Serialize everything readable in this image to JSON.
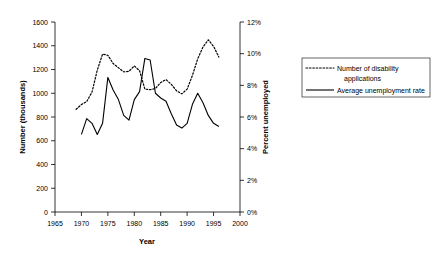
{
  "chart_data": {
    "type": "line",
    "title": "",
    "xlabel": "Year",
    "ylabel": "Number (thousands)",
    "y2label": "Percent unemployed",
    "xlim": [
      1965,
      2000
    ],
    "ylim": [
      0,
      1600
    ],
    "y2lim": [
      0,
      12
    ],
    "grid": false,
    "legend_position": "right",
    "x_ticks": [
      "1965",
      "1970",
      "1975",
      "1980",
      "1985",
      "1990",
      "1995",
      "2000"
    ],
    "x_tick_values": [
      1965,
      1970,
      1975,
      1980,
      1985,
      1990,
      1995,
      2000
    ],
    "y_ticks": [
      "0",
      "200",
      "400",
      "600",
      "800",
      "1000",
      "1200",
      "1400",
      "1600"
    ],
    "y_tick_values": [
      0,
      200,
      400,
      600,
      800,
      1000,
      1200,
      1400,
      1600
    ],
    "y2_ticks": [
      "0%",
      "2%",
      "4%",
      "6%",
      "8%",
      "10%",
      "12%"
    ],
    "y2_tick_values": [
      0,
      2,
      4,
      6,
      8,
      10,
      12
    ],
    "series": [
      {
        "name": "Number of disability applications",
        "style": "dotted",
        "axis": "left",
        "units": "thousands",
        "x": [
          1969,
          1970,
          1971,
          1972,
          1973,
          1974,
          1975,
          1976,
          1977,
          1978,
          1979,
          1980,
          1981,
          1982,
          1983,
          1984,
          1985,
          1986,
          1987,
          1988,
          1989,
          1990,
          1991,
          1992,
          1993,
          1994,
          1995,
          1996
        ],
        "values": [
          865,
          905,
          930,
          1010,
          1195,
          1330,
          1320,
          1250,
          1215,
          1180,
          1185,
          1230,
          1190,
          1035,
          1030,
          1040,
          1090,
          1115,
          1075,
          1020,
          995,
          1035,
          1150,
          1290,
          1390,
          1450,
          1395,
          1305
        ]
      },
      {
        "name": "Average unemployment rate",
        "style": "solid",
        "axis": "right",
        "units": "percent",
        "x": [
          1970,
          1971,
          1972,
          1973,
          1974,
          1975,
          1976,
          1977,
          1978,
          1979,
          1980,
          1981,
          1982,
          1983,
          1984,
          1985,
          1986,
          1987,
          1988,
          1989,
          1990,
          1991,
          1992,
          1993,
          1994,
          1995,
          1996
        ],
        "values": [
          4.9,
          5.9,
          5.6,
          4.9,
          5.6,
          8.5,
          7.7,
          7.1,
          6.1,
          5.8,
          7.1,
          7.6,
          9.7,
          9.6,
          7.5,
          7.2,
          7.0,
          6.2,
          5.5,
          5.3,
          5.6,
          6.8,
          7.5,
          6.9,
          6.1,
          5.6,
          5.4
        ]
      }
    ]
  },
  "legend": {
    "items": [
      {
        "label_line1": "Number of disability",
        "label_line2": "applications",
        "style": "dotted"
      },
      {
        "label_line1": "Average unemployment rate",
        "label_line2": "",
        "style": "solid"
      }
    ]
  }
}
